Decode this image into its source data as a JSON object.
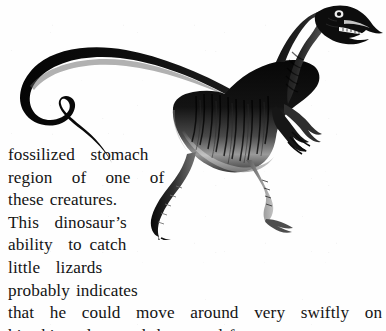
{
  "page": {
    "background_color": "#fefefe",
    "text_color": "#141414"
  },
  "illustration": {
    "subject": "dinosaur",
    "species_depicted": "small bipedal theropod dinosaur",
    "silhouette_color": "#0b0b0b",
    "highlight_color": "#b9b9b9",
    "description": "Side view of a slender black theropod dinosaur facing right, with a long curving tail at the left, striped body shading, two clawed forelimbs, two long skinny legs with three-toed feet, and an open toothed mouth"
  },
  "caption": {
    "lines": [
      "fossilized  stomach",
      "region  of  one  of",
      "these creatures.",
      "This  dinosaur’s",
      "ability  to catch",
      "little  lizards",
      "probably indicates",
      "that  he  could  move  around  very  swiftly  on",
      "his skinny legs and three-toed feet."
    ],
    "line_1": "fossilized  stomach",
    "line_2": "region  of  one  of",
    "line_3": "these creatures.",
    "line_4": "This  dinosaur’s",
    "line_5": "ability  to catch",
    "line_6": "little  lizards",
    "line_7": "probably indicates",
    "line_8": "that  he  could  move  around  very  swiftly  on",
    "line_9": "his skinny legs and three-toed feet."
  }
}
